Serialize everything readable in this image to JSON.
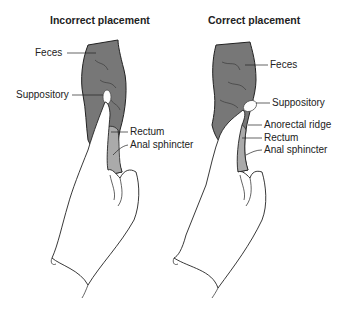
{
  "panels": [
    {
      "title": "Incorrect placement",
      "labels": {
        "feces": "Feces",
        "suppository": "Suppository",
        "rectum": "Rectum",
        "anal_sphincter": "Anal sphincter"
      }
    },
    {
      "title": "Correct placement",
      "labels": {
        "feces": "Feces",
        "suppository": "Suppository",
        "anorectal_ridge": "Anorectal ridge",
        "rectum": "Rectum",
        "anal_sphincter": "Anal sphincter"
      }
    }
  ],
  "colors": {
    "feces": "#7a7a7a",
    "rectum": "#a9a9a9",
    "outline": "#222222",
    "glove": "#ffffff"
  }
}
